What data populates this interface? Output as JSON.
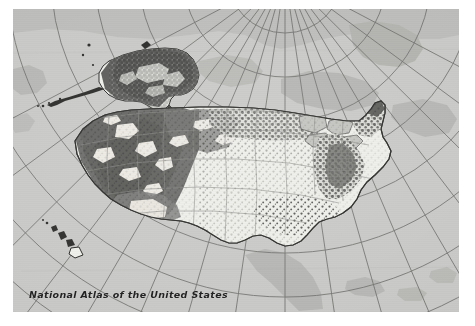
{
  "image": {
    "kind": "scanned-thematic-map",
    "width": 475,
    "height": 326,
    "page_background": "#ffffff"
  },
  "map": {
    "caption": "National Atlas of the United States",
    "frame": {
      "x": 13,
      "y": 9,
      "width": 446,
      "height": 303
    },
    "projection_note": "polar/conic graticule converging toward the top of the frame",
    "colors": {
      "ocean_background": "#c9c9c7",
      "foreign_land": "#b3b3b0",
      "graticule_line": "#6e6e6c",
      "us_land_light": "#eeeeea",
      "us_theme_dark": "#4f4f4d",
      "coastline": "#2a2a28",
      "state_border": "#7d7d7a",
      "caption_text": "#232323"
    },
    "features": [
      {
        "name": "conterminous-united-states",
        "label": "Conterminous United States"
      },
      {
        "name": "alaska",
        "label": "Alaska"
      },
      {
        "name": "hawaii",
        "label": "Hawaii"
      },
      {
        "name": "canada-and-neighboring-land",
        "label": "Surrounding land"
      }
    ],
    "graticule": {
      "meridians": 17,
      "parallels": 9,
      "converge_point": {
        "x": 272,
        "y": -34
      }
    }
  }
}
